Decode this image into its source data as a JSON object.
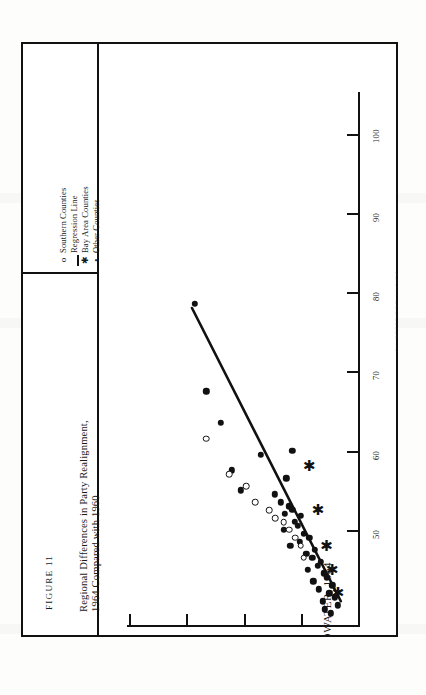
{
  "figure": {
    "number": "FIGURE 11",
    "caption_line1": "Regional Differences in Party Realignment,",
    "caption_line2": "1964 Compared with 1960"
  },
  "legend": {
    "items": [
      {
        "symbol": "o",
        "label": "Southern Counties",
        "kind": "open-circle"
      },
      {
        "symbol": "—",
        "label": "Regression Line",
        "kind": "line"
      },
      {
        "symbol": "✱",
        "label": "Bay Area Counties",
        "kind": "asterisk"
      },
      {
        "symbol": "•",
        "label": "Other Counties",
        "kind": "filled-dot"
      }
    ]
  },
  "chart_data": {
    "type": "scatter",
    "xlabel": "% NIXON, 1960",
    "ylabel": "% GOLDWATER, 1964",
    "xlim": [
      38,
      105
    ],
    "ylim": [
      30,
      70
    ],
    "xticks": [
      50,
      60,
      70,
      80,
      90,
      100
    ],
    "yticks": [
      30,
      40,
      50,
      60,
      70
    ],
    "xtick_labels": [
      "50",
      "60",
      "70",
      "80",
      "90",
      "100"
    ],
    "ytick_labels": [
      "30",
      "40",
      "50",
      "60",
      "70"
    ],
    "grid": false,
    "legend_position": "left-panel",
    "orientation": "rotated-90-ccw",
    "series": [
      {
        "name": "Other Counties",
        "marker": "filled-dot",
        "points": [
          [
            78.5,
            58.5
          ],
          [
            67.5,
            56.5
          ],
          [
            63.5,
            54.0
          ],
          [
            59.5,
            47.0
          ],
          [
            57.5,
            52.0
          ],
          [
            55.0,
            50.5
          ],
          [
            54.5,
            44.5
          ],
          [
            53.5,
            43.5
          ],
          [
            53.0,
            42.0
          ],
          [
            52.5,
            41.5
          ],
          [
            52.0,
            42.8
          ],
          [
            51.8,
            40.0
          ],
          [
            51.0,
            41.0
          ],
          [
            50.5,
            40.5
          ],
          [
            50.0,
            43.0
          ],
          [
            49.5,
            39.5
          ],
          [
            49.0,
            38.5
          ],
          [
            48.5,
            40.2
          ],
          [
            48.0,
            41.8
          ],
          [
            47.5,
            37.5
          ],
          [
            47.0,
            39.0
          ],
          [
            46.5,
            38.0
          ],
          [
            46.0,
            36.5
          ],
          [
            45.5,
            37.0
          ],
          [
            45.0,
            38.8
          ],
          [
            44.5,
            36.0
          ],
          [
            44.0,
            35.5
          ],
          [
            43.5,
            37.8
          ],
          [
            43.0,
            34.5
          ],
          [
            42.5,
            36.8
          ],
          [
            42.0,
            35.0
          ],
          [
            41.5,
            34.0
          ],
          [
            41.0,
            36.2
          ],
          [
            40.5,
            33.5
          ],
          [
            40.0,
            35.8
          ],
          [
            39.5,
            34.8
          ],
          [
            60.0,
            41.5
          ],
          [
            56.5,
            42.5
          ]
        ]
      },
      {
        "name": "Southern Counties",
        "marker": "open-circle",
        "points": [
          [
            61.5,
            56.5
          ],
          [
            57.0,
            52.5
          ],
          [
            55.5,
            49.5
          ],
          [
            53.5,
            48.0
          ],
          [
            52.5,
            45.5
          ],
          [
            51.5,
            44.5
          ],
          [
            51.0,
            43.0
          ],
          [
            50.0,
            42.0
          ],
          [
            49.0,
            41.0
          ],
          [
            48.0,
            40.0
          ],
          [
            46.5,
            39.5
          ]
        ]
      },
      {
        "name": "Bay Area Counties",
        "marker": "asterisk",
        "points": [
          [
            58.0,
            38.5
          ],
          [
            52.5,
            37.0
          ],
          [
            48.0,
            35.5
          ],
          [
            45.0,
            34.5
          ],
          [
            42.0,
            33.5
          ]
        ]
      }
    ],
    "regression_line": {
      "name": "Regression Line",
      "x_start": 78.0,
      "y_start": 59.0,
      "x_end": 41.0,
      "y_end": 33.0
    }
  }
}
